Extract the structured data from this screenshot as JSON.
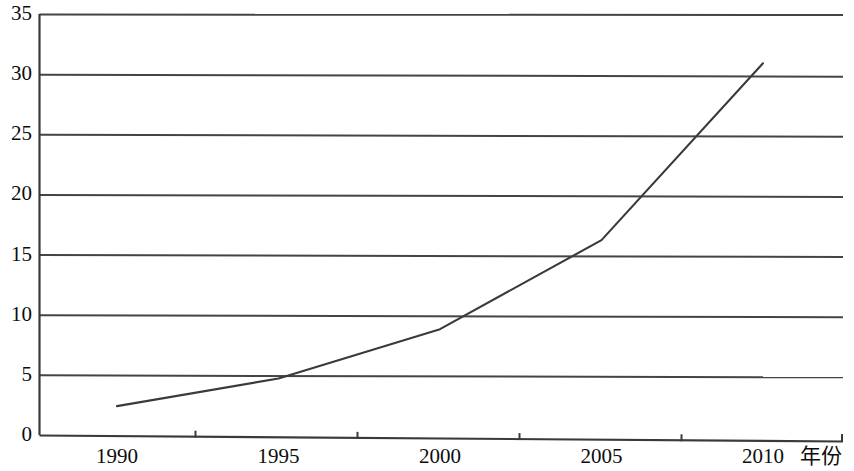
{
  "chart_data": {
    "type": "line",
    "title": "",
    "subtitle": "",
    "xlabel": "年份",
    "ylabel": "",
    "x": [
      1990,
      1995,
      2000,
      2005,
      2010
    ],
    "categories": [
      "1990",
      "1995",
      "2000",
      "2005",
      "2010"
    ],
    "values": [
      2.4,
      4.7,
      8.8,
      16.2,
      30.9
    ],
    "series": [
      {
        "name": "",
        "values": [
          2.4,
          4.7,
          8.8,
          16.2,
          30.9
        ]
      }
    ],
    "xtick_labels": [
      "1990",
      "1995",
      "2000",
      "2005",
      "2010"
    ],
    "ytick_labels": [
      "0",
      "5",
      "10",
      "15",
      "20",
      "25",
      "30",
      "35"
    ],
    "ytick_values": [
      0,
      5,
      10,
      15,
      20,
      25,
      30,
      35
    ],
    "ylim": [
      0,
      35
    ],
    "xlim": [
      1988.5,
      2013.5
    ],
    "grid": "horizontal",
    "legend": "none",
    "annotations": [],
    "line_color": "#3a3a3a",
    "grid_color": "#444444",
    "axis_color": "#3a3a3a",
    "background_color": "#ffffff"
  },
  "axis": {
    "x_title": "年份"
  }
}
